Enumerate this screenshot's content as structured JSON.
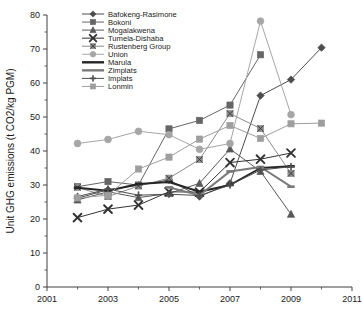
{
  "chart_data": {
    "type": "line",
    "title": "",
    "xlabel": "",
    "ylabel": "Unit GHG emissions (t CO2/kg PGM)",
    "xlim": [
      2001,
      2011
    ],
    "ylim": [
      0,
      80
    ],
    "xticks": [
      2001,
      2003,
      2005,
      2007,
      2009,
      2011
    ],
    "xtick_labels": [
      "2001",
      "2003",
      "2005",
      "2007",
      "2009",
      "2011"
    ],
    "xticks_minor": [
      2002,
      2004,
      2006,
      2008,
      2010
    ],
    "yticks": [
      0,
      10,
      20,
      30,
      40,
      50,
      60,
      70,
      80
    ],
    "ytick_labels": [
      "0",
      "10",
      "20",
      "30",
      "40",
      "50",
      "60",
      "70",
      "80"
    ],
    "grid": false,
    "legend_position": "top-left",
    "series": [
      {
        "name": "Bafokeng-Rasimone",
        "marker": "diamond",
        "color": "#4d4d4d",
        "x": [
          2002,
          2003,
          2004,
          2005,
          2006,
          2007,
          2008,
          2009,
          2010
        ],
        "values": [
          26.1,
          28.6,
          29.9,
          31.5,
          26.6,
          30.5,
          56.3,
          61.0,
          70.4
        ]
      },
      {
        "name": "Bokoni",
        "marker": "square",
        "color": "#666666",
        "x": [
          2002,
          2003,
          2004,
          2005,
          2006,
          2007,
          2008
        ],
        "values": [
          29.5,
          31.0,
          30.0,
          46.5,
          49.0,
          53.5,
          68.3
        ]
      },
      {
        "name": "Mogalakwena",
        "marker": "triangle",
        "color": "#595959",
        "x": [
          2002,
          2003,
          2004,
          2005,
          2006,
          2007,
          2008,
          2009
        ],
        "values": [
          25.6,
          28.0,
          26.3,
          27.5,
          30.5,
          40.6,
          34.0,
          21.4
        ]
      },
      {
        "name": "Tumela-Dishaba",
        "marker": "x",
        "color": "#333333",
        "x": [
          2002,
          2003,
          2004,
          2005,
          2006,
          2007,
          2008,
          2009
        ],
        "values": [
          20.4,
          22.9,
          24.1,
          28.0,
          27.9,
          36.6,
          37.6,
          39.4
        ]
      },
      {
        "name": "Rustenberg Group",
        "marker": "square-x",
        "color": "#8c8c8c",
        "x": [
          2002,
          2003,
          2004,
          2005,
          2006,
          2007,
          2008,
          2009
        ],
        "values": [
          29.3,
          26.6,
          29.7,
          32.0,
          37.5,
          51.0,
          46.6,
          33.4
        ]
      },
      {
        "name": "Union",
        "marker": "circle",
        "color": "#a6a6a6",
        "x": [
          2002,
          2003,
          2004,
          2005,
          2006,
          2007,
          2008,
          2009
        ],
        "values": [
          42.2,
          43.4,
          45.8,
          44.8,
          40.5,
          42.2,
          78.2,
          50.7
        ]
      },
      {
        "name": "Marula",
        "marker": "line",
        "color": "#262626",
        "x": [
          2002,
          2003,
          2004,
          2005,
          2006,
          2007,
          2008,
          2009
        ],
        "values": [
          29.2,
          28.3,
          30.3,
          30.9,
          28.0,
          30.0,
          35.0,
          35.5
        ]
      },
      {
        "name": "Zimplats",
        "marker": "line",
        "color": "#7a7a7a",
        "x": [
          2005,
          2006,
          2007,
          2008,
          2009
        ],
        "values": [
          29.3,
          27.0,
          34.0,
          35.3,
          29.5
        ]
      },
      {
        "name": "Implats",
        "marker": "plus",
        "color": "#4f4f4f",
        "x": [
          2002,
          2003,
          2004,
          2005,
          2006,
          2007,
          2008,
          2009
        ],
        "values": [
          26.6,
          28.8,
          27.0,
          27.3,
          26.9,
          30.0,
          34.4,
          35.4
        ]
      },
      {
        "name": "Lonmin",
        "marker": "square",
        "color": "#9e9e9e",
        "x": [
          2002,
          2003,
          2004,
          2005,
          2006,
          2007,
          2008,
          2009,
          2010
        ],
        "values": [
          26.2,
          27.0,
          34.7,
          38.2,
          43.5,
          47.5,
          43.7,
          48.0,
          48.2
        ]
      }
    ]
  }
}
